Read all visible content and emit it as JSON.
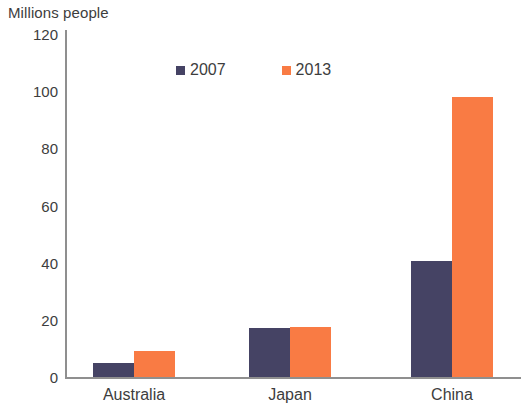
{
  "chart_data": {
    "type": "bar",
    "title": "",
    "ylabel": "Millions people",
    "xlabel": "",
    "categories": [
      "Australia",
      "Japan",
      "China"
    ],
    "series": [
      {
        "name": "2007",
        "color": "#454364",
        "values": [
          5,
          17,
          40.5
        ]
      },
      {
        "name": "2013",
        "color": "#f97b44",
        "values": [
          9,
          17.5,
          98
        ]
      }
    ],
    "ylim": [
      0,
      120
    ],
    "yticks": [
      0,
      20,
      40,
      60,
      80,
      100,
      120
    ],
    "ytick_labels": [
      "0",
      "20",
      "40",
      "60",
      "80",
      "100",
      "120"
    ],
    "grid": false,
    "legend_position": "top-center"
  },
  "legend": {
    "entries": [
      {
        "label": "2007",
        "color": "#454364"
      },
      {
        "label": "2013",
        "color": "#f97b44"
      }
    ]
  },
  "colors": {
    "series_2007": "#454364",
    "series_2013": "#f97b44",
    "axis": "#8f8f8f",
    "text": "#3d3d3d",
    "background": "#ffffff"
  }
}
